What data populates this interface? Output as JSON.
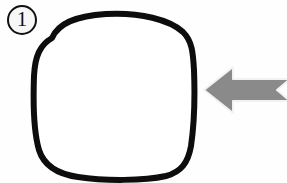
{
  "canvas": {
    "width": 287,
    "height": 183,
    "background_color": "#fefefe",
    "title": "Step 1 diagram: rounded square with pointing arrow"
  },
  "step_badge": {
    "label": "1",
    "shape": "circle",
    "center_x": 22,
    "center_y": 20,
    "radius": 14,
    "ring_color": "#111111",
    "ring_width": 2,
    "fill_color": "#f7f7f7",
    "text_color": "#111111"
  },
  "shapes": [
    {
      "name": "rounded-square",
      "description": "hand-drawn squircle outline",
      "stroke_color": "#0d0d0d",
      "stroke_width": 6,
      "fill_color": "#ffffff",
      "bounds": {
        "left": 33,
        "top": 13,
        "right": 196,
        "bottom": 180
      },
      "path": "M 52 38 C 58 24 74 16 106 14 C 140 12 170 20 183 32 C 192 41 193 52 194 70 C 195 96 194 126 191 146 C 188 163 181 172 166 176 C 144 181 104 181 78 177 C 57 174 44 166 39 150 C 34 133 33 104 34 76 C 35 56 40 45 52 38 Z"
    }
  ],
  "arrow": {
    "name": "pointer-arrow",
    "direction": "left",
    "color": "#8a8a8a",
    "outline_color": "#f2f2f2",
    "tip_x": 204,
    "tip_y": 90,
    "head_top_y": 68,
    "head_bottom_y": 112,
    "shaft_top_y": 80,
    "shaft_bottom_y": 100,
    "tail_x": 287,
    "tail_notch_depth": 14,
    "cropped_at_right_edge": true,
    "points": "204,90 233,67 233,79 290,79 277,90 290,101 233,101 233,113"
  },
  "labels": {
    "badge_aria": "step number one",
    "shape_aria": "rounded square outline",
    "arrow_aria": "gray arrow pointing left at the shape"
  }
}
